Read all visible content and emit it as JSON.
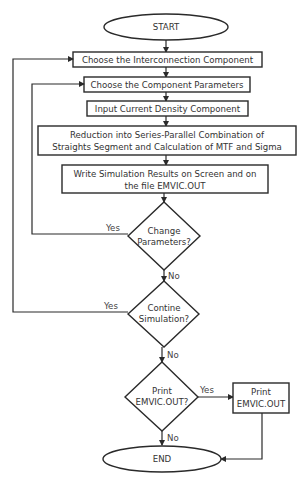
{
  "flowchart": {
    "start": {
      "label": "START"
    },
    "steps": [
      {
        "id": "choose-interconnection",
        "lines": [
          "Choose the Interconnection Component"
        ]
      },
      {
        "id": "choose-parameters",
        "lines": [
          "Choose the Component Parameters"
        ]
      },
      {
        "id": "input-current-density",
        "lines": [
          "Input Current Density Component"
        ]
      },
      {
        "id": "reduction",
        "lines": [
          "Reduction into Series-Parallel Combination of",
          "Straights Segment and Calculation of MTF and Sigma"
        ]
      },
      {
        "id": "write-results",
        "lines": [
          "Write Simulation Results on Screen and on",
          "the file EMVIC.OUT"
        ]
      }
    ],
    "decisions": [
      {
        "id": "change-parameters",
        "lines": [
          "Change",
          "Parameters?"
        ],
        "yes": "Yes",
        "no": "No"
      },
      {
        "id": "continue-simulation",
        "lines": [
          "Contine",
          "Simulation?"
        ],
        "yes": "Yes",
        "no": "No"
      },
      {
        "id": "print-output",
        "lines": [
          "Print",
          "EMVIC.OUT?"
        ],
        "yes": "Yes",
        "no": "No"
      }
    ],
    "print_box": {
      "lines": [
        "Print",
        "EMVIC.OUT"
      ]
    },
    "end": {
      "label": "END"
    }
  }
}
